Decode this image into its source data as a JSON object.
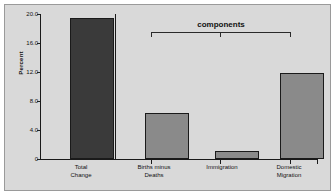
{
  "chart_data": {
    "type": "bar",
    "title": "",
    "subtitle": "",
    "xlabel": "",
    "ylabel": "Percent",
    "ylim": [
      0,
      20
    ],
    "yticks": [
      "0",
      "4.0",
      "8.0",
      "12.0",
      "16.0",
      "20.0"
    ],
    "ytick_values": [
      0,
      4,
      8,
      12,
      16,
      20
    ],
    "grid": true,
    "legend": "none",
    "categories": [
      "Total\nChange",
      "Births minus\nDeaths",
      "Immigration",
      "Domestic\nMigration"
    ],
    "values": [
      19.5,
      6.4,
      1.1,
      11.8
    ],
    "bar_colors": [
      "#3a3a3a",
      "#8a8a8a",
      "#8a8a8a",
      "#8a8a8a"
    ],
    "annotations": [
      {
        "name": "components-bracket",
        "text": "components",
        "spans_categories": [
          "Births minus\nDeaths",
          "Immigration",
          "Domestic\nMigration"
        ]
      }
    ]
  },
  "figure": {
    "y_axis_title": "Percent",
    "components_label": "components",
    "bars": [
      {
        "label": "Total\nChange",
        "value": 19.5,
        "color": "#3a3a3a"
      },
      {
        "label": "Births minus\nDeaths",
        "value": 6.4,
        "color": "#8a8a8a"
      },
      {
        "label": "Immigration",
        "value": 1.1,
        "color": "#8a8a8a"
      },
      {
        "label": "Domestic\nMigration",
        "value": 11.8,
        "color": "#8a8a8a"
      }
    ],
    "y_ticks": [
      {
        "label": "20.0",
        "value": 20
      },
      {
        "label": "16.0",
        "value": 16
      },
      {
        "label": "12.0",
        "value": 12
      },
      {
        "label": "8.0",
        "value": 8
      },
      {
        "label": "4.0",
        "value": 4
      },
      {
        "label": "0",
        "value": 0
      }
    ],
    "colors": {
      "background": "#d9d9d9",
      "frame_border": "#9a9a9a",
      "axis": "#1a1a1a",
      "gridline": "#6e6e6e",
      "dark_bar": "#3a3a3a",
      "gray_bar": "#8a8a8a",
      "text": "#111111"
    }
  }
}
